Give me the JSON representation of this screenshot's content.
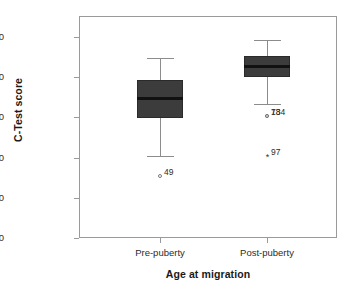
{
  "chart_data": {
    "type": "box",
    "title": "",
    "xlabel": "Age at migration",
    "ylabel": "C-Test score",
    "ylim": [
      0,
      110
    ],
    "ytick_labels": [
      "0.00",
      "20.00",
      "40.00",
      "60.00",
      "80.00",
      "100.00"
    ],
    "ytick_values": [
      0,
      20,
      40,
      60,
      80,
      100
    ],
    "categories": [
      "Pre-puberty",
      "Post-puberty"
    ],
    "grid": false,
    "legend": "none",
    "boxes": [
      {
        "category": "Pre-puberty",
        "whisker_low": 41.0,
        "q1": 59.5,
        "median": 69.5,
        "q3": 78.5,
        "whisker_high": 89.5,
        "outliers": [
          {
            "label": "49",
            "value": 31.0,
            "marker": "circle"
          }
        ]
      },
      {
        "category": "Post-puberty",
        "whisker_low": 66.5,
        "q1": 80.0,
        "median": 85.5,
        "q3": 90.5,
        "whisker_high": 98.5,
        "outliers": [
          {
            "label": "134",
            "value": 60.5,
            "marker": "circle"
          },
          {
            "label": "78",
            "value": 60.5,
            "marker": "circle"
          },
          {
            "label": "97",
            "value": 41.0,
            "marker": "star"
          }
        ]
      }
    ]
  },
  "axes": {
    "y_title": "C-Test score",
    "x_title": "Age at migration",
    "y_ticks": [
      {
        "label": "100.00",
        "value": 100
      },
      {
        "label": "80.00",
        "value": 80
      },
      {
        "label": "60.00",
        "value": 60
      },
      {
        "label": "40.00",
        "value": 40
      },
      {
        "label": "20.00",
        "value": 20
      },
      {
        "label": "0.00",
        "value": 0
      }
    ],
    "x_ticks": [
      {
        "label": "Pre-puberty"
      },
      {
        "label": "Post-puberty"
      }
    ]
  },
  "colors": {
    "box_fill": "#3c3c3c",
    "box_border": "#2a2a2a",
    "median_line": "#111111",
    "whisker": "#8c8c8c",
    "frame": "#9a9a9a",
    "text": "#2b2b2b",
    "background": "#ffffff"
  }
}
